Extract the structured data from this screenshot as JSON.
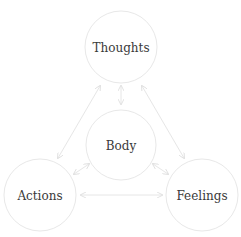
{
  "diagram": {
    "nodes": [
      {
        "id": "thoughts",
        "label": "Thoughts",
        "cx": 121,
        "cy": 47,
        "r": 36
      },
      {
        "id": "body",
        "label": "Body",
        "cx": 121,
        "cy": 145,
        "r": 35
      },
      {
        "id": "actions",
        "label": "Actions",
        "cx": 40,
        "cy": 195,
        "r": 36
      },
      {
        "id": "feelings",
        "label": "Feelings",
        "cx": 202,
        "cy": 195,
        "r": 36
      }
    ],
    "edges": [
      {
        "from": "thoughts",
        "to": "body",
        "bidirectional": true
      },
      {
        "from": "thoughts",
        "to": "actions",
        "bidirectional": true
      },
      {
        "from": "thoughts",
        "to": "feelings",
        "bidirectional": true
      },
      {
        "from": "body",
        "to": "actions",
        "bidirectional": true
      },
      {
        "from": "body",
        "to": "feelings",
        "bidirectional": true
      },
      {
        "from": "actions",
        "to": "feelings",
        "bidirectional": true
      }
    ],
    "colors": {
      "stroke": "#e6e6e6",
      "text": "#3a3a3a",
      "background": "#ffffff"
    }
  }
}
